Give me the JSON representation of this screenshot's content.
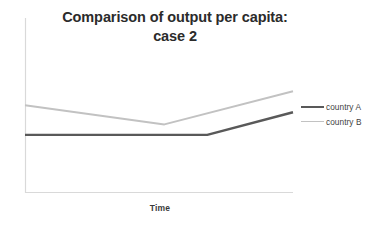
{
  "chart_data": {
    "type": "line",
    "title": "Comparison of output per capita: case 2",
    "title_line1": "Comparison of output per capita:",
    "title_line2": "case 2",
    "xlabel": "Time",
    "ylabel": "",
    "grid": false,
    "legend_position": "right",
    "xlim": [
      0,
      100
    ],
    "ylim": [
      0,
      100
    ],
    "x_tick_labels": [],
    "y_tick_labels": [],
    "series": [
      {
        "name": "country A",
        "color": "#595959",
        "width": 2.4,
        "x": [
          0,
          68,
          100
        ],
        "y": [
          33,
          33,
          46
        ],
        "points": [
          {
            "x": 0,
            "y": 33
          },
          {
            "x": 68,
            "y": 33
          },
          {
            "x": 100,
            "y": 46
          }
        ]
      },
      {
        "name": "country B",
        "color": "#c2c2c2",
        "width": 1.9,
        "x": [
          0,
          52,
          100
        ],
        "y": [
          50,
          39,
          58
        ],
        "points": [
          {
            "x": 0,
            "y": 50
          },
          {
            "x": 52,
            "y": 39
          },
          {
            "x": 100,
            "y": 58
          }
        ]
      }
    ],
    "annotations": []
  },
  "legend": {
    "entries": [
      {
        "label": "country A"
      },
      {
        "label": "country B"
      }
    ]
  },
  "axes": {
    "x_title": "Time",
    "axis_color": "#d9d9d9"
  },
  "colors": {
    "background": "#ffffff",
    "title_text": "#2b2b2b",
    "series_a": "#595959",
    "series_b": "#c2c2c2",
    "axis": "#d9d9d9"
  }
}
